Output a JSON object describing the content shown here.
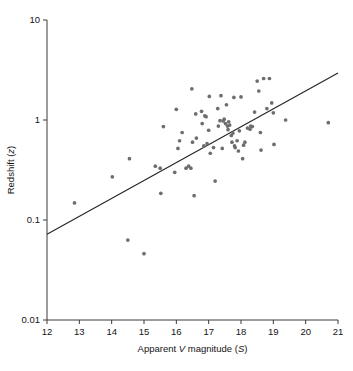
{
  "figure": {
    "background": "#ffffff",
    "point_color": "#6e6e6e",
    "line_color": "#262626",
    "axis_color": "#3a3a3a"
  },
  "chart_data": {
    "type": "scatter",
    "title": "",
    "subtitle": "",
    "xlabel": "Apparent V magnitude (S)",
    "xlabel_parts": [
      "Apparent ",
      "V",
      " magnitude (",
      "S",
      ")"
    ],
    "ylabel": "Redshift (z)",
    "ylabel_parts": [
      "Redshift (",
      "z",
      ")"
    ],
    "xscale": "linear",
    "yscale": "log",
    "xlim": [
      12,
      21
    ],
    "ylim": [
      0.01,
      10
    ],
    "grid": false,
    "legend": null,
    "xticks": [
      12,
      13,
      14,
      15,
      16,
      17,
      18,
      19,
      20,
      21
    ],
    "xtick_labels": [
      "12",
      "13",
      "14",
      "15",
      "16",
      "17",
      "18",
      "19",
      "20",
      "21"
    ],
    "yticks": [
      0.01,
      0.1,
      1,
      10
    ],
    "ytick_labels": [
      "0.01",
      "0.1",
      "1",
      "10"
    ],
    "series": [
      {
        "name": "quasars",
        "type": "scatter",
        "marker": "circle",
        "color": "#6e6e6e",
        "points": [
          [
            12.85,
            0.148
          ],
          [
            14.02,
            0.27
          ],
          [
            14.5,
            0.063
          ],
          [
            14.55,
            0.41
          ],
          [
            15.0,
            0.046
          ],
          [
            15.35,
            0.345
          ],
          [
            15.5,
            0.33
          ],
          [
            15.52,
            0.185
          ],
          [
            15.6,
            0.86
          ],
          [
            15.95,
            0.3
          ],
          [
            16.0,
            1.28
          ],
          [
            16.05,
            0.52
          ],
          [
            16.1,
            0.62
          ],
          [
            16.18,
            0.75
          ],
          [
            16.3,
            0.33
          ],
          [
            16.38,
            0.345
          ],
          [
            16.45,
            0.33
          ],
          [
            16.48,
            2.05
          ],
          [
            16.5,
            0.6
          ],
          [
            16.55,
            0.175
          ],
          [
            16.6,
            1.15
          ],
          [
            16.62,
            0.66
          ],
          [
            16.78,
            1.22
          ],
          [
            16.8,
            0.92
          ],
          [
            16.85,
            0.55
          ],
          [
            16.88,
            1.1
          ],
          [
            16.92,
            1.08
          ],
          [
            16.95,
            0.58
          ],
          [
            17.0,
            0.79
          ],
          [
            17.02,
            1.72
          ],
          [
            17.05,
            0.465
          ],
          [
            17.15,
            0.53
          ],
          [
            17.2,
            0.245
          ],
          [
            17.28,
            1.3
          ],
          [
            17.3,
            0.87
          ],
          [
            17.35,
            0.985
          ],
          [
            17.38,
            1.75
          ],
          [
            17.42,
            0.52
          ],
          [
            17.45,
            0.98
          ],
          [
            17.48,
            1.02
          ],
          [
            17.52,
            0.92
          ],
          [
            17.55,
            1.42
          ],
          [
            17.58,
            0.87
          ],
          [
            17.6,
            0.8
          ],
          [
            17.62,
            0.96
          ],
          [
            17.65,
            0.89
          ],
          [
            17.7,
            0.7
          ],
          [
            17.72,
            0.6
          ],
          [
            17.75,
            0.74
          ],
          [
            17.78,
            1.68
          ],
          [
            17.8,
            0.55
          ],
          [
            17.82,
            0.53
          ],
          [
            17.88,
            0.62
          ],
          [
            17.92,
            0.49
          ],
          [
            17.95,
            0.78
          ],
          [
            18.0,
            1.7
          ],
          [
            18.05,
            0.41
          ],
          [
            18.08,
            0.56
          ],
          [
            18.12,
            0.6
          ],
          [
            18.2,
            0.83
          ],
          [
            18.28,
            0.81
          ],
          [
            18.3,
            0.87
          ],
          [
            18.35,
            0.86
          ],
          [
            18.42,
            1.2
          ],
          [
            18.5,
            2.45
          ],
          [
            18.55,
            1.95
          ],
          [
            18.6,
            0.75
          ],
          [
            18.62,
            0.5
          ],
          [
            18.7,
            2.6
          ],
          [
            18.8,
            1.3
          ],
          [
            18.88,
            2.6
          ],
          [
            18.95,
            1.48
          ],
          [
            19.0,
            1.18
          ],
          [
            19.02,
            0.57
          ],
          [
            19.38,
            1.0
          ],
          [
            20.7,
            0.94
          ]
        ]
      },
      {
        "name": "fit-line",
        "type": "line",
        "color": "#262626",
        "points": [
          [
            12.0,
            0.072
          ],
          [
            21.0,
            2.95
          ]
        ]
      }
    ]
  }
}
